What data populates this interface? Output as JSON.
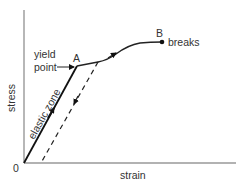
{
  "diagram": {
    "axes": {
      "x_label": "strain",
      "y_label": "stress",
      "origin_label": "0"
    },
    "points": {
      "yield": {
        "letter": "A",
        "label_line1": "yield",
        "label_line2": "point"
      },
      "break": {
        "letter": "B",
        "label": "breaks"
      }
    },
    "zones": {
      "elastic": "elastic zone"
    },
    "colors": {
      "axis": "#999999",
      "curve": "#111111",
      "text": "#333333",
      "background": "#ffffff"
    }
  }
}
